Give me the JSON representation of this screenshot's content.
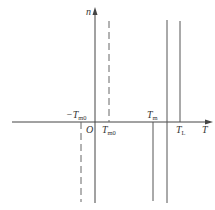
{
  "diagram": {
    "title": "",
    "axes": {
      "x_label": "T",
      "y_label": "n",
      "origin_label": "O"
    },
    "lines": [
      {
        "id": "neg-Tm0",
        "label": "−T",
        "sub": "m0",
        "style": "dashed",
        "region": "below-axis"
      },
      {
        "id": "Tm0",
        "label": "T",
        "sub": "m0",
        "style": "dashed",
        "region": "above-axis"
      },
      {
        "id": "Tm",
        "label": "T",
        "sub": "m",
        "style": "solid",
        "region": "below-axis"
      },
      {
        "id": "middle",
        "label": "",
        "sub": "",
        "style": "solid",
        "region": "full"
      },
      {
        "id": "TL",
        "label": "T",
        "sub": "L",
        "style": "solid",
        "region": "above-axis"
      }
    ],
    "colors": {
      "line": "#555555",
      "axis": "#444444",
      "background": "#ffffff"
    }
  }
}
